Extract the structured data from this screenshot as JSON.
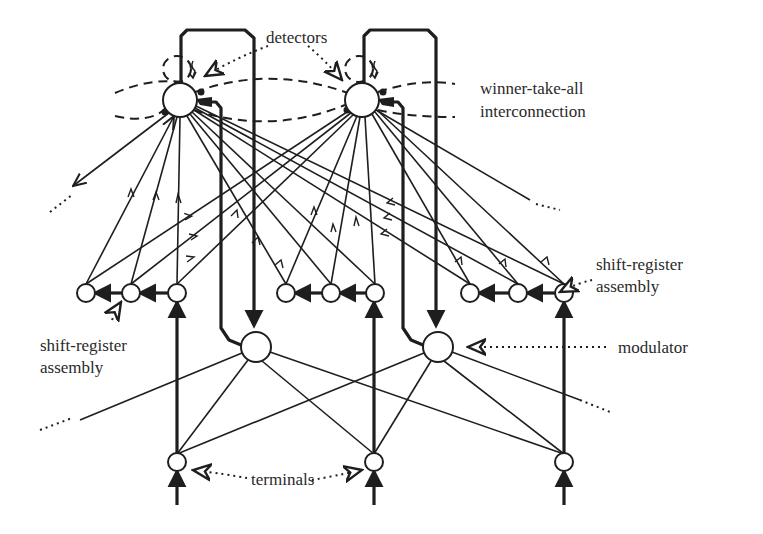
{
  "figure": {
    "colors": {
      "ink": "#1e1e1e",
      "background": "#ffffff",
      "text": "#2a2a2a"
    }
  },
  "labels": {
    "detectors": "detectors",
    "wta_line1": "winner-take-all",
    "wta_line2": "interconnection",
    "sr_right_line1": "shift-register",
    "sr_right_line2": "assembly",
    "sr_left_line1": "shift-register",
    "sr_left_line2": "assembly",
    "modulator": "modulator",
    "terminals": "terminals"
  },
  "nodes": {
    "detectors": [
      {
        "id": "detector-1",
        "cx": 180,
        "cy": 100,
        "r": 17
      },
      {
        "id": "detector-2",
        "cx": 362,
        "cy": 100,
        "r": 17
      }
    ],
    "shift_registers": [
      {
        "group": "left",
        "cells": [
          86,
          131,
          177
        ],
        "cy": 293,
        "r": 9
      },
      {
        "group": "middle",
        "cells": [
          286,
          331,
          375
        ],
        "cy": 293,
        "r": 9
      },
      {
        "group": "right",
        "cells": [
          470,
          518,
          564
        ],
        "cy": 293,
        "r": 9
      }
    ],
    "modulators": [
      {
        "id": "modulator-1",
        "cx": 256,
        "cy": 347,
        "r": 15
      },
      {
        "id": "modulator-2",
        "cx": 438,
        "cy": 347,
        "r": 15
      }
    ],
    "terminals": [
      {
        "id": "terminal-1",
        "cx": 177,
        "cy": 462,
        "r": 9
      },
      {
        "id": "terminal-2",
        "cx": 374,
        "cy": 462,
        "r": 9
      },
      {
        "id": "terminal-3",
        "cx": 564,
        "cy": 462,
        "r": 9
      }
    ]
  }
}
